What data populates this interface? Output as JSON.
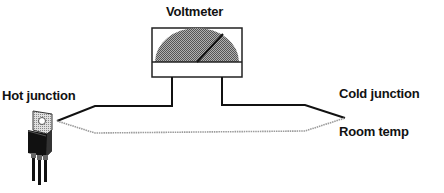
{
  "diagram": {
    "labels": {
      "voltmeter": "Voltmeter",
      "hot_junction": "Hot junction",
      "cold_junction": "Cold junction",
      "room_temp": "Room temp"
    },
    "components": [
      {
        "name": "voltmeter",
        "type": "analog meter"
      },
      {
        "name": "transistor",
        "type": "TO-220 package",
        "attached_to": "hot junction"
      },
      {
        "name": "wire-a",
        "style": "solid black"
      },
      {
        "name": "wire-b",
        "style": "dotted gray"
      }
    ],
    "colors": {
      "wire_a": "#111111",
      "wire_b": "#9a9a9a",
      "dial": "#8c8c8c",
      "transistor_body": "#111111",
      "tab": "#8a8a8a"
    }
  }
}
